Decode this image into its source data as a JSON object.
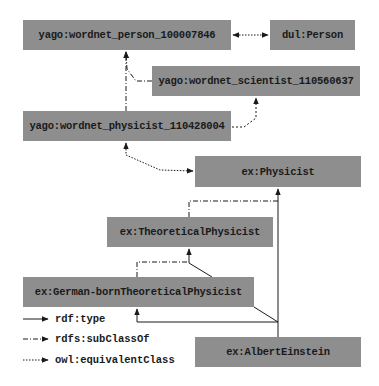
{
  "nodes": {
    "person": "yago:wordnet_person_100007846",
    "dul_person": "dul:Person",
    "scientist": "yago:wordnet_scientist_110560637",
    "physicist_yago": "yago:wordnet_physicist_110428004",
    "ex_physicist": "ex:Physicist",
    "theoretical": "ex:TheoreticalPhysicist",
    "german_born": "ex:German-bornTheoreticalPhysicist",
    "einstein": "ex:AlbertEinstein"
  },
  "edges": [
    {
      "from": "person",
      "to": "dul_person",
      "type": "owl:equivalentClass"
    },
    {
      "from": "scientist",
      "to": "person",
      "type": "rdfs:subClassOf"
    },
    {
      "from": "physicist_yago",
      "to": "person",
      "type": "rdfs:subClassOf"
    },
    {
      "from": "physicist_yago",
      "to": "scientist",
      "type": "rdfs:subClassOf"
    },
    {
      "from": "physicist_yago",
      "to": "ex_physicist",
      "type": "owl:equivalentClass"
    },
    {
      "from": "theoretical",
      "to": "ex_physicist",
      "type": "rdfs:subClassOf"
    },
    {
      "from": "german_born",
      "to": "theoretical",
      "type": "rdfs:subClassOf"
    },
    {
      "from": "einstein",
      "to": "ex_physicist",
      "type": "rdf:type"
    },
    {
      "from": "einstein",
      "to": "theoretical",
      "type": "rdf:type"
    },
    {
      "from": "einstein",
      "to": "german_born",
      "type": "rdf:type"
    }
  ],
  "legend": {
    "type": "rdf:type",
    "subclass": "rdfs:subClassOf",
    "equivalent": "owl:equivalentClass"
  },
  "colors": {
    "node_fill": "#8e8e8e",
    "edge": "#1a1a1a",
    "background": "#ffffff"
  }
}
